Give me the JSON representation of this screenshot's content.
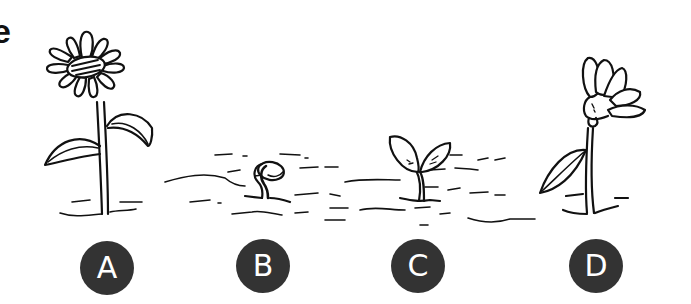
{
  "partial_heading_text": "e",
  "stages": [
    {
      "label": "A",
      "description": "fully bloomed flower with stem and two leaves",
      "cx": 107,
      "cy": 268
    },
    {
      "label": "B",
      "description": "seed sprouting from the soil",
      "cx": 263,
      "cy": 266
    },
    {
      "label": "C",
      "description": "young seedling with two leaves",
      "cx": 418,
      "cy": 266
    },
    {
      "label": "D",
      "description": "flower bud beginning to open with one leaf",
      "cx": 596,
      "cy": 266
    }
  ],
  "colors": {
    "ink": "#111111",
    "label_bg": "#333333",
    "label_text": "#ffffff",
    "background": "#ffffff"
  }
}
